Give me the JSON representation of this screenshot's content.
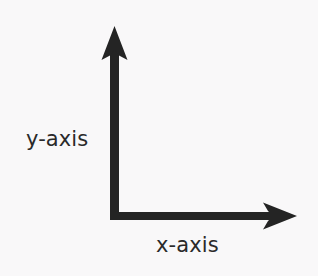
{
  "diagram": {
    "type": "coordinate-axes",
    "background_color": "#f9f8f9",
    "stroke_color": "#242424",
    "text_color": "#2a2a2a",
    "origin": {
      "x": 114,
      "y": 216
    },
    "axes": [
      {
        "name": "y-axis",
        "label": "y-axis",
        "direction": "up",
        "shaft_from": {
          "x": 114,
          "y": 220
        },
        "shaft_to": {
          "x": 114,
          "y": 50
        },
        "arrow_tip": {
          "x": 114,
          "y": 26
        },
        "shaft_thickness": 9,
        "arrowhead_width": 26,
        "arrowhead_length": 32,
        "label_position": {
          "x": 26,
          "y": 129
        }
      },
      {
        "name": "x-axis",
        "label": "x-axis",
        "direction": "right",
        "shaft_from": {
          "x": 110,
          "y": 216
        },
        "shaft_to": {
          "x": 272,
          "y": 216
        },
        "arrow_tip": {
          "x": 297,
          "y": 216
        },
        "shaft_thickness": 8,
        "arrowhead_width": 26,
        "arrowhead_length": 32,
        "label_position": {
          "x": 156,
          "y": 235
        }
      }
    ]
  }
}
